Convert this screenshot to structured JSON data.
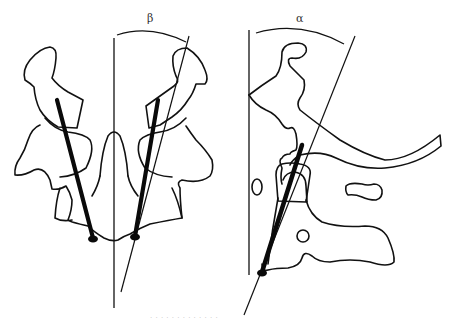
{
  "figure": {
    "panels": [
      {
        "id": "coronal-view",
        "description": "Posterior/coronal view of atlas-axis with bilateral screws",
        "angle_label": "β"
      },
      {
        "id": "sagittal-view",
        "description": "Lateral/sagittal view of upper cervical spine with screw trajectory",
        "angle_label": "α"
      }
    ],
    "caption": "· · · ·  ·  · · ·  · ·   · · ·"
  },
  "colors": {
    "line": "#111111",
    "screw": "#0a0a0a",
    "background": "#ffffff",
    "caption": "#c8c8c8"
  }
}
